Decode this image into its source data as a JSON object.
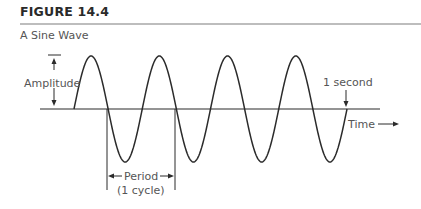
{
  "figure": {
    "label": "FIGURE 14.4",
    "title": "A Sine Wave"
  },
  "diagram": {
    "type": "sine-wave",
    "cycles": 4,
    "duration_label": "1 second",
    "annotations": {
      "amplitude": "Amplitude",
      "period_line1": "Period",
      "period_line2": "(1 cycle)",
      "time_axis": "Time",
      "end_marker": "1 second"
    },
    "colors": {
      "wave": "#2b2b2b",
      "text": "#555555"
    }
  }
}
